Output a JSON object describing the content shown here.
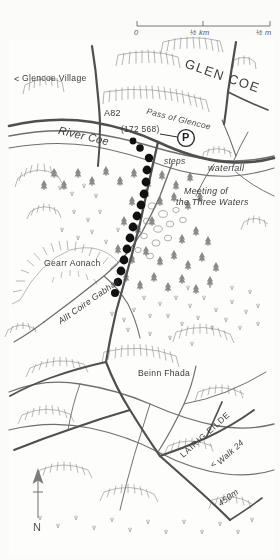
{
  "map": {
    "title_region": "Glen Coe",
    "north_arrow": {
      "label": "N",
      "icon": "north-arrow-icon"
    },
    "scalebar": {
      "icon": "scale-bar-icon",
      "ticks": [
        "0",
        "½ km",
        "½ m"
      ],
      "zero": "0",
      "mid": "½ km",
      "end": "½ m"
    },
    "labels": {
      "glen_coe": "GLEN COE",
      "glencoe_village": "Glencoe Village",
      "glencoe_village_arrow": "<",
      "pass_of_glencoe": "Pass of Glencoe",
      "a82": "A82",
      "river_coe": "River Coe",
      "grid_ref": "(172 568)",
      "parking": "P",
      "steps": "steps",
      "waterfall": "waterfall",
      "meeting_line1": "Meeting of",
      "meeting_line2": "the Three Waters",
      "gearr_aonach": "Gearr Aonach",
      "allt_coire_gabhail": "Allt Coire Gabhail",
      "beinn_fhada": "Beinn Fhada",
      "lairig_eilde": "LAIRIG EILDE",
      "walk_24": "Walk 24",
      "walk_24_arrow": "<",
      "contour_450": "450m"
    },
    "colors": {
      "paper": "#fdfdfc",
      "ink": "#4a4a4a",
      "route_dot": "#111111",
      "road": "#555555",
      "water": "#6b6b6b",
      "scrub": "#8d8d8d",
      "text": "#3b3b3b"
    },
    "legend_implicit": {
      "route_symbol": "black-dot-route",
      "parking_symbol": "P-in-circle",
      "hachure_symbol": "crag-hachures",
      "tree_symbol": "conifer"
    }
  }
}
